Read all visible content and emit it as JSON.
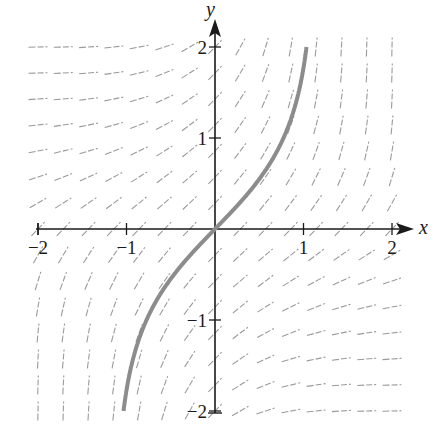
{
  "chart_data": {
    "type": "slope-field",
    "equation_hint": "dy/dx = e^(xy)",
    "xlabel": "x",
    "ylabel": "y",
    "xlim": [
      -2,
      2
    ],
    "ylim": [
      -2,
      2
    ],
    "x_ticks": [
      {
        "value": -2,
        "label": "−2"
      },
      {
        "value": -1,
        "label": "−1"
      },
      {
        "value": 1,
        "label": "1"
      },
      {
        "value": 2,
        "label": "2"
      }
    ],
    "y_ticks": [
      {
        "value": 2,
        "label": "2"
      },
      {
        "value": 1,
        "label": "1"
      },
      {
        "value": -1,
        "label": "−1"
      },
      {
        "value": -2,
        "label": "−2"
      }
    ],
    "grid": false,
    "field": {
      "n_per_axis": 15,
      "segment_length_px": 19,
      "color": "#9a9a9a"
    },
    "solution_curve": {
      "passes_through": [
        0,
        0
      ],
      "color": "#8c8c8c",
      "approx_points": [
        [
          -0.88,
          -2
        ],
        [
          -0.6,
          -0.75
        ],
        [
          -0.3,
          -0.31
        ],
        [
          0,
          0
        ],
        [
          0.3,
          0.31
        ],
        [
          0.6,
          0.75
        ],
        [
          0.86,
          2
        ]
      ]
    }
  },
  "colors": {
    "axis": "#1a1a1a",
    "field": "#9a9a9a",
    "curve": "#8c8c8c",
    "background": "#ffffff"
  }
}
